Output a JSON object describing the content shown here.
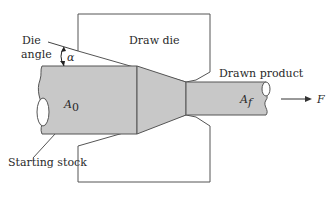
{
  "diagram": {
    "labels": {
      "die_angle_line1": "Die",
      "die_angle_line2": "angle",
      "alpha": "α",
      "draw_die": "Draw die",
      "drawn_product": "Drawn product",
      "initial_area": "A",
      "initial_area_sub": "0",
      "final_area": "A",
      "final_area_sub": "f",
      "force": "F",
      "starting_stock": "Starting stock"
    },
    "colors": {
      "stock_fill": "#c8c8c8",
      "outline": "#444444",
      "die_fill": "#ffffff"
    }
  }
}
